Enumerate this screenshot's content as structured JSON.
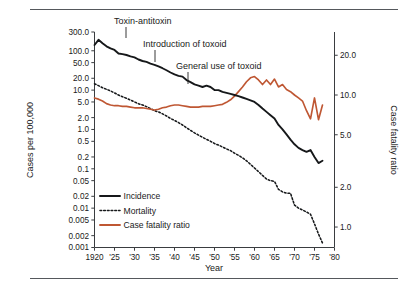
{
  "figure": {
    "top_rule": true,
    "bottom_rule": true
  },
  "chart_data": {
    "type": "line",
    "title": "",
    "subtitle": "",
    "xlabel": "Year",
    "ylabel": "Cases per 100,000",
    "y2label": "Case fatality ratio",
    "xscale": "linear",
    "yscale": "log",
    "y2scale": "log",
    "grid": false,
    "legend_position": "inside-lower-left",
    "xlim": [
      1920,
      1980
    ],
    "ylim": [
      0.001,
      300.0
    ],
    "y2lim": [
      0.7,
      30.0
    ],
    "xticks": [
      1920,
      1925,
      1930,
      1935,
      1940,
      1945,
      1950,
      1955,
      1960,
      1965,
      1970,
      1975,
      1980
    ],
    "xtick_labels": [
      "1920",
      "'25",
      "'30",
      "'35",
      "'40",
      "'45",
      "'50",
      "'55",
      "'60",
      "'65",
      "'70",
      "'75",
      "'80"
    ],
    "yticks": [
      300.0,
      100.0,
      50.0,
      20.0,
      10.0,
      5.0,
      2.0,
      1.0,
      0.5,
      0.2,
      0.1,
      0.05,
      0.02,
      0.01,
      0.005,
      0.002,
      0.001
    ],
    "ytick_labels": [
      "300.0",
      "100.0",
      "50.0",
      "20.0",
      "10.0",
      "5.0",
      "2.0",
      "1.0",
      "0.5",
      "0.2",
      "0.1",
      "0.05",
      "0.02",
      "0.01",
      "0.005",
      "0.002",
      "0.001"
    ],
    "y2ticks": [
      20.0,
      10.0,
      5.0,
      2.0,
      1.0
    ],
    "y2tick_labels": [
      "20.0",
      "10.0",
      "5.0",
      "2.0",
      "1.0"
    ],
    "colors": {
      "incidence": "#16181a",
      "mortality": "#16181a",
      "case_fatality_ratio": "#bf5733",
      "axis": "#3a3d40",
      "rule": "#55585c"
    },
    "series": [
      {
        "name": "Incidence",
        "axis": "left",
        "style": "solid",
        "color": "#16181a",
        "x": [
          1920,
          1921,
          1922,
          1923,
          1924,
          1925,
          1926,
          1927,
          1928,
          1929,
          1930,
          1931,
          1932,
          1933,
          1934,
          1935,
          1936,
          1937,
          1938,
          1939,
          1940,
          1941,
          1942,
          1943,
          1944,
          1945,
          1946,
          1947,
          1948,
          1949,
          1950,
          1951,
          1952,
          1953,
          1954,
          1955,
          1956,
          1957,
          1958,
          1959,
          1960,
          1961,
          1962,
          1963,
          1964,
          1965,
          1966,
          1967,
          1968,
          1969,
          1970,
          1971,
          1972,
          1973,
          1974,
          1975,
          1976,
          1977
        ],
        "values": [
          140,
          190,
          155,
          130,
          115,
          105,
          85,
          82,
          78,
          72,
          68,
          60,
          55,
          52,
          47,
          44,
          40,
          36,
          32,
          28,
          25,
          23,
          22,
          18,
          16,
          14,
          13,
          12,
          13,
          12,
          10,
          10,
          9,
          8.5,
          8,
          7.5,
          7,
          6.5,
          6,
          5.5,
          5,
          4.2,
          3.4,
          2.8,
          2.3,
          1.9,
          1.3,
          1.0,
          0.75,
          0.55,
          0.42,
          0.34,
          0.3,
          0.27,
          0.3,
          0.2,
          0.14,
          0.16
        ]
      },
      {
        "name": "Mortality",
        "axis": "left",
        "style": "dotted",
        "color": "#16181a",
        "x": [
          1920,
          1921,
          1922,
          1923,
          1924,
          1925,
          1926,
          1927,
          1928,
          1929,
          1930,
          1931,
          1932,
          1933,
          1934,
          1935,
          1936,
          1937,
          1938,
          1939,
          1940,
          1941,
          1942,
          1943,
          1944,
          1945,
          1946,
          1947,
          1948,
          1949,
          1950,
          1951,
          1952,
          1953,
          1954,
          1955,
          1956,
          1957,
          1958,
          1959,
          1960,
          1961,
          1962,
          1963,
          1964,
          1965,
          1966,
          1967,
          1968,
          1969,
          1970,
          1971,
          1972,
          1973,
          1974,
          1975,
          1976,
          1977
        ],
        "values": [
          14.5,
          13.0,
          11.5,
          10.5,
          9.5,
          8.5,
          7.5,
          6.8,
          6.2,
          5.6,
          5.0,
          4.5,
          4.2,
          3.8,
          3.4,
          3.0,
          2.8,
          2.5,
          2.2,
          1.9,
          1.7,
          1.5,
          1.3,
          1.1,
          0.95,
          0.82,
          0.72,
          0.63,
          0.56,
          0.5,
          0.44,
          0.4,
          0.36,
          0.32,
          0.29,
          0.25,
          0.22,
          0.19,
          0.16,
          0.13,
          0.105,
          0.085,
          0.068,
          0.055,
          0.05,
          0.048,
          0.03,
          0.026,
          0.024,
          0.024,
          0.012,
          0.01,
          0.009,
          0.008,
          0.007,
          0.004,
          0.0022,
          0.0013
        ]
      },
      {
        "name": "Case fatality ratio",
        "axis": "right",
        "style": "solid",
        "color": "#bf5733",
        "x": [
          1920,
          1921,
          1922,
          1923,
          1924,
          1925,
          1926,
          1927,
          1928,
          1929,
          1930,
          1931,
          1932,
          1933,
          1934,
          1935,
          1936,
          1937,
          1938,
          1939,
          1940,
          1941,
          1942,
          1943,
          1944,
          1945,
          1946,
          1947,
          1948,
          1949,
          1950,
          1951,
          1952,
          1953,
          1954,
          1955,
          1956,
          1957,
          1958,
          1959,
          1960,
          1961,
          1962,
          1963,
          1964,
          1965,
          1966,
          1967,
          1968,
          1969,
          1970,
          1971,
          1972,
          1973,
          1974,
          1975,
          1976,
          1977
        ],
        "values": [
          9.5,
          9.3,
          9.0,
          8.6,
          8.4,
          8.3,
          8.3,
          8.2,
          8.2,
          8.1,
          8.0,
          8.0,
          8.0,
          7.9,
          7.8,
          7.7,
          7.8,
          8.0,
          8.1,
          8.3,
          8.4,
          8.4,
          8.3,
          8.2,
          8.1,
          8.1,
          8.1,
          8.2,
          8.2,
          8.2,
          8.3,
          8.4,
          8.5,
          8.8,
          9.2,
          9.8,
          10.6,
          11.5,
          12.6,
          13.5,
          13.8,
          13.0,
          12.0,
          13.0,
          12.0,
          13.2,
          11.5,
          12.0,
          11.0,
          10.6,
          10.0,
          9.5,
          9.0,
          7.6,
          6.6,
          9.5,
          6.5,
          8.4
        ]
      }
    ],
    "annotations": [
      {
        "id": "toxin-antitoxin",
        "text": "Toxin-antitoxin",
        "year": 1924,
        "text_x": 114,
        "text_y": 24,
        "tick_x": 126,
        "tick_y0": 27,
        "tick_y1": 38
      },
      {
        "id": "introduction-of-toxoid",
        "text": "Introduction of toxoid",
        "year": 1930,
        "text_x": 143,
        "text_y": 47,
        "tick_x": 155,
        "tick_y0": 50,
        "tick_y1": 62
      },
      {
        "id": "general-use-of-toxoid",
        "text": "General use of toxoid",
        "year": 1937,
        "text_x": 176,
        "text_y": 69,
        "tick_x": 188,
        "tick_y0": 72,
        "tick_y1": 84
      }
    ],
    "legend": [
      {
        "label": "Incidence",
        "style": "solid",
        "color": "#16181a"
      },
      {
        "label": "Mortality",
        "style": "dotted",
        "color": "#16181a"
      },
      {
        "label": "Case fatality ratio",
        "style": "solid",
        "color": "#bf5733"
      }
    ]
  }
}
